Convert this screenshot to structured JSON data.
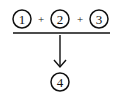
{
  "diagram": {
    "inputs": [
      {
        "label": "1"
      },
      {
        "label": "2"
      },
      {
        "label": "3"
      }
    ],
    "operator": "+",
    "output": {
      "label": "4"
    },
    "colors": {
      "stroke": "#111111",
      "background": "#ffffff"
    }
  }
}
